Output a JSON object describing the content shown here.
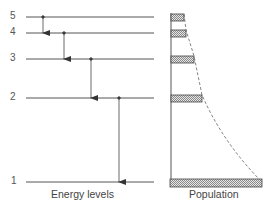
{
  "diagram": {
    "type": "energy-level-population",
    "levels": [
      {
        "label": "5",
        "y": 17,
        "pop_width": 13
      },
      {
        "label": "4",
        "y": 33,
        "pop_width": 15
      },
      {
        "label": "3",
        "y": 59,
        "pop_width": 23
      },
      {
        "label": "2",
        "y": 98,
        "pop_width": 31
      },
      {
        "label": "1",
        "y": 182,
        "pop_width": 92
      }
    ],
    "transitions": [
      {
        "from": "5",
        "to": "4"
      },
      {
        "from": "4",
        "to": "3"
      },
      {
        "from": "3",
        "to": "2"
      },
      {
        "from": "2",
        "to": "1"
      }
    ],
    "captions": {
      "energy_levels": "Energy levels",
      "population": "Population"
    },
    "colors": {
      "line": "#555555",
      "hatch": "#888888"
    }
  }
}
